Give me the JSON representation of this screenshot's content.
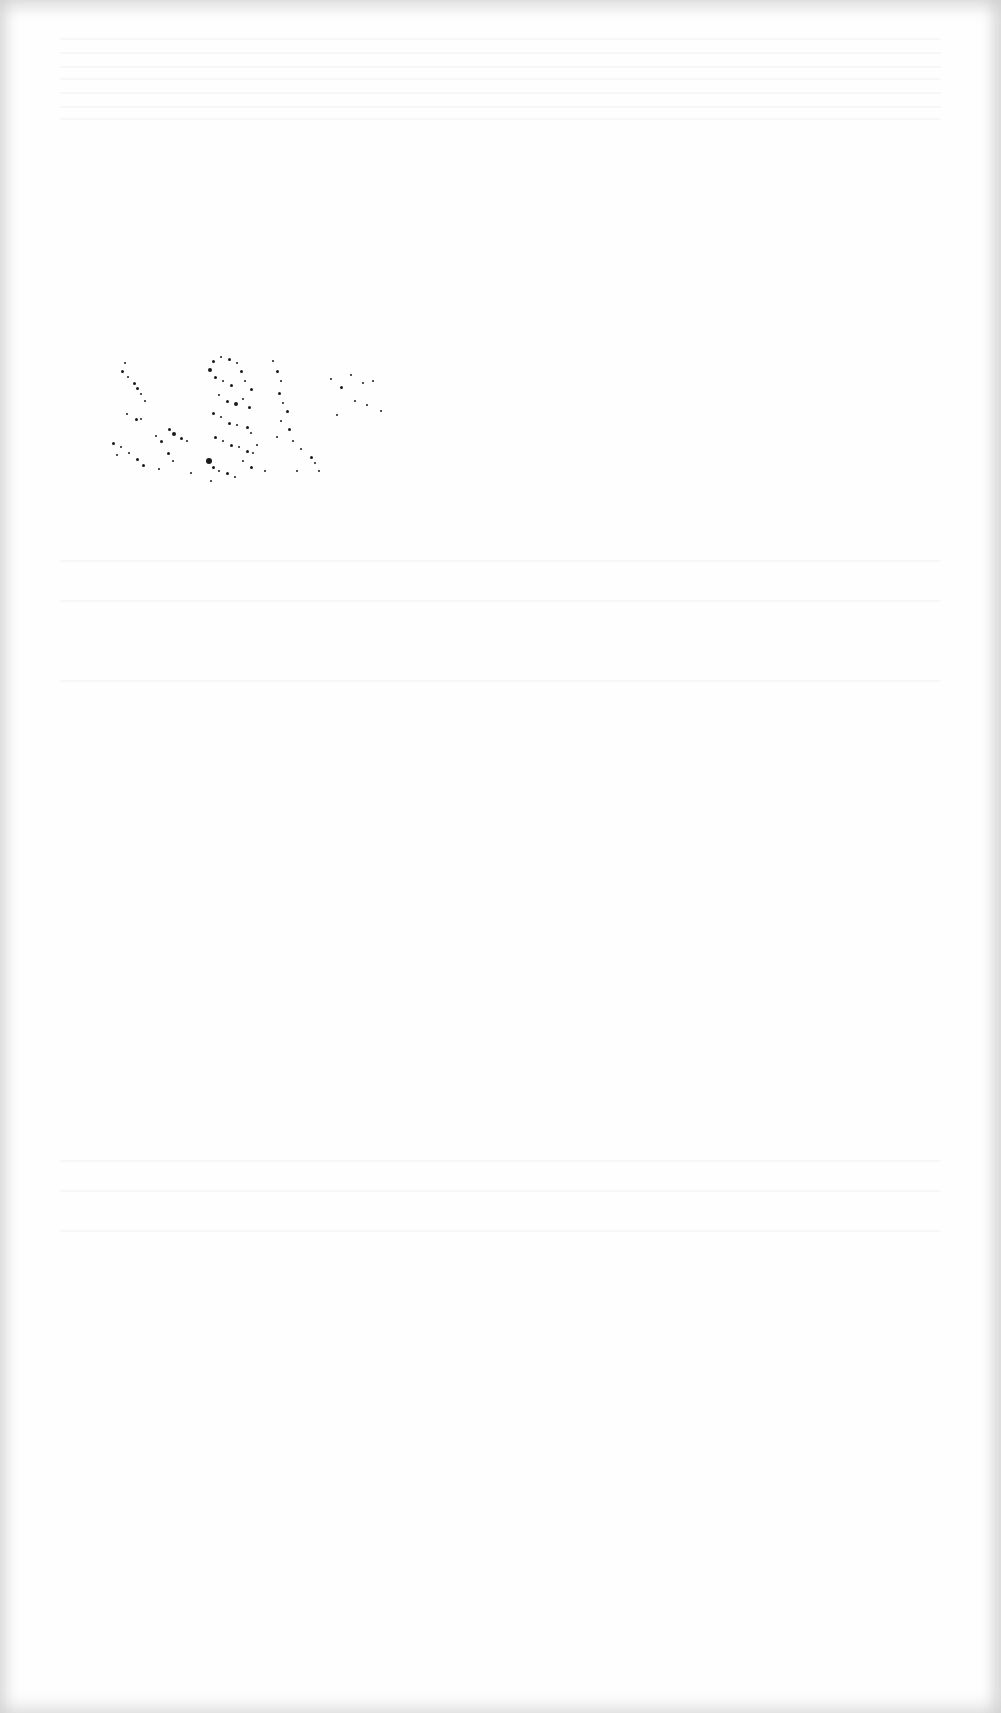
{
  "page": {
    "type": "blank-scanned-page",
    "background_color": "#fefefe",
    "edge_color": "#d6d6d6",
    "visible_text": []
  },
  "artifacts": {
    "speckle_noise": {
      "color": "#1a1a1a",
      "region": {
        "x": 100,
        "y": 340,
        "width": 280,
        "height": 135
      },
      "dots": [
        [
          24,
          22,
          2
        ],
        [
          21,
          30,
          3
        ],
        [
          27,
          36,
          2
        ],
        [
          33,
          42,
          3
        ],
        [
          36,
          47,
          3
        ],
        [
          40,
          53,
          2
        ],
        [
          44,
          60,
          2
        ],
        [
          26,
          73,
          2
        ],
        [
          35,
          78,
          3
        ],
        [
          40,
          78,
          2
        ],
        [
          68,
          88,
          3
        ],
        [
          72,
          92,
          4
        ],
        [
          80,
          97,
          3
        ],
        [
          86,
          100,
          2
        ],
        [
          12,
          102,
          3
        ],
        [
          20,
          106,
          2
        ],
        [
          28,
          112,
          2
        ],
        [
          36,
          118,
          3
        ],
        [
          42,
          124,
          3
        ],
        [
          16,
          114,
          2
        ],
        [
          55,
          95,
          2
        ],
        [
          60,
          100,
          3
        ],
        [
          67,
          112,
          3
        ],
        [
          72,
          120,
          2
        ],
        [
          108,
          28,
          4
        ],
        [
          112,
          20,
          3
        ],
        [
          120,
          16,
          2
        ],
        [
          128,
          18,
          3
        ],
        [
          136,
          22,
          2
        ],
        [
          140,
          30,
          3
        ],
        [
          114,
          36,
          3
        ],
        [
          122,
          40,
          2
        ],
        [
          130,
          44,
          3
        ],
        [
          144,
          40,
          2
        ],
        [
          150,
          48,
          3
        ],
        [
          118,
          54,
          2
        ],
        [
          126,
          60,
          3
        ],
        [
          134,
          62,
          4
        ],
        [
          142,
          58,
          2
        ],
        [
          148,
          66,
          3
        ],
        [
          112,
          72,
          3
        ],
        [
          120,
          76,
          2
        ],
        [
          128,
          82,
          3
        ],
        [
          136,
          84,
          2
        ],
        [
          146,
          86,
          3
        ],
        [
          150,
          92,
          2
        ],
        [
          114,
          96,
          3
        ],
        [
          122,
          100,
          2
        ],
        [
          130,
          104,
          3
        ],
        [
          138,
          106,
          2
        ],
        [
          146,
          110,
          3
        ],
        [
          152,
          112,
          2
        ],
        [
          106,
          118,
          6
        ],
        [
          112,
          126,
          3
        ],
        [
          118,
          130,
          2
        ],
        [
          126,
          132,
          3
        ],
        [
          134,
          136,
          2
        ],
        [
          110,
          140,
          2
        ],
        [
          142,
          120,
          2
        ],
        [
          150,
          126,
          3
        ],
        [
          156,
          104,
          2
        ],
        [
          172,
          20,
          2
        ],
        [
          176,
          30,
          3
        ],
        [
          180,
          40,
          2
        ],
        [
          178,
          52,
          3
        ],
        [
          182,
          62,
          2
        ],
        [
          186,
          70,
          3
        ],
        [
          180,
          80,
          2
        ],
        [
          188,
          88,
          3
        ],
        [
          176,
          96,
          2
        ],
        [
          192,
          100,
          2
        ],
        [
          200,
          108,
          2
        ],
        [
          210,
          116,
          3
        ],
        [
          214,
          122,
          2
        ],
        [
          218,
          130,
          2
        ],
        [
          230,
          38,
          2
        ],
        [
          240,
          46,
          3
        ],
        [
          250,
          34,
          2
        ],
        [
          262,
          42,
          2
        ],
        [
          272,
          40,
          2
        ],
        [
          254,
          60,
          2
        ],
        [
          266,
          64,
          2
        ],
        [
          236,
          74,
          2
        ],
        [
          280,
          70,
          2
        ],
        [
          196,
          130,
          2
        ],
        [
          164,
          130,
          2
        ],
        [
          90,
          132,
          2
        ],
        [
          58,
          128,
          2
        ]
      ]
    },
    "bleed_through_lines_y": [
      38,
      52,
      66,
      78,
      92,
      106,
      118,
      560,
      600,
      680,
      1160,
      1190,
      1230
    ]
  }
}
